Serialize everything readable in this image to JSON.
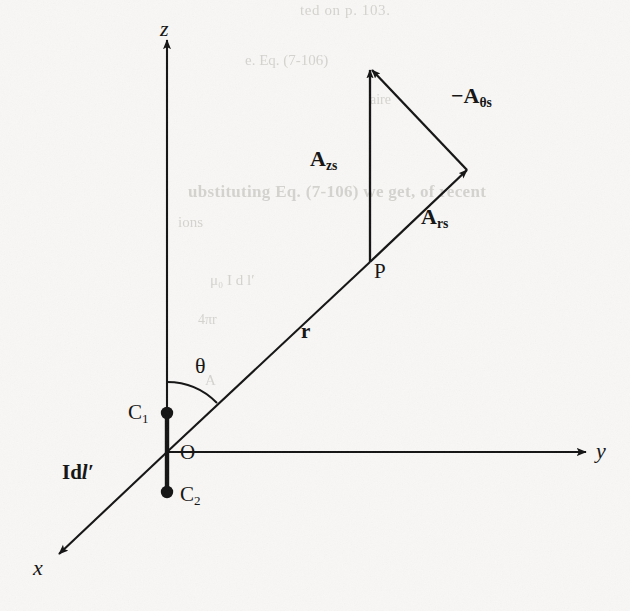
{
  "figure": {
    "kind": "vector-diagram",
    "background_color": "#f8f7f5",
    "ink_color": "#131313"
  },
  "axes": {
    "z": {
      "label": "z",
      "arrow": "up"
    },
    "y": {
      "label": "y",
      "arrow": "right"
    },
    "x": {
      "label": "x",
      "arrow": "down-left"
    }
  },
  "points": {
    "origin": {
      "label": "O"
    },
    "field_point": {
      "label": "P"
    },
    "c1": {
      "label": "C",
      "subscript": "1"
    },
    "c2": {
      "label": "C",
      "subscript": "2"
    }
  },
  "annotations": {
    "radius": "r",
    "polar_angle": "θ",
    "current_element_prefix": "Id",
    "current_element_symbol": "l",
    "current_element_prime": "′"
  },
  "vectors": [
    {
      "name": "A_zs",
      "base": "A",
      "subscript": "zs",
      "sign": "",
      "direction": "+z"
    },
    {
      "name": "A_rs",
      "base": "A",
      "subscript": "rs",
      "sign": "",
      "direction": "radial outward along r"
    },
    {
      "name": "-A_theta_s",
      "base": "A",
      "subscript": "θs",
      "sign": "−",
      "direction": "negative theta"
    }
  ],
  "bleed_through_text": {
    "line1": "ted on p. 103.",
    "line2": "e. Eq. (7-106)",
    "line3": "aire",
    "line4": "ubstituting Eq. (7-106) we get, of recent",
    "line5": "ions",
    "line6": "μ₀ I d l′",
    "line7": "4πr",
    "line8": "A"
  }
}
